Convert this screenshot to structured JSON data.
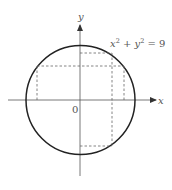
{
  "figure": {
    "equation": {
      "x": "x",
      "sup1": "2",
      "plus": " + ",
      "y": "y",
      "sup2": "2",
      "eq": " = 9"
    },
    "axes": {
      "x_label": "x",
      "y_label": "y",
      "origin_label": "0"
    },
    "circle": {
      "radius": 3,
      "center": [
        0,
        0
      ]
    },
    "colors": {
      "curve": "#222222",
      "axis": "#444444",
      "dashed": "#666666",
      "text": "#555555"
    }
  }
}
